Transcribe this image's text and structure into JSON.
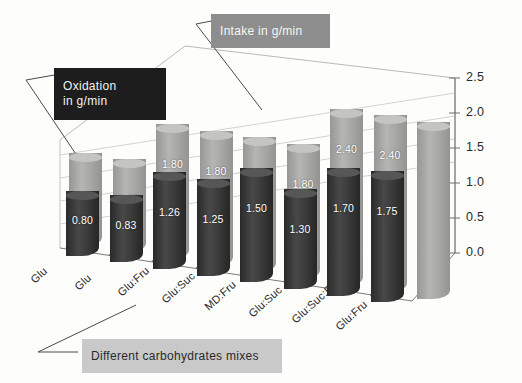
{
  "chart_data": {
    "type": "bar",
    "title": "",
    "xlabel": "Different carbohydrates mixes",
    "ylabel": "",
    "ylim": [
      0.0,
      2.5
    ],
    "yticks": [
      "0.0",
      "0.5",
      "1.0",
      "1.5",
      "2.0",
      "2.5"
    ],
    "grid": true,
    "legend_position": "callout-boxes",
    "projection": "3d-cylinder",
    "categories": [
      "Glu",
      "Glu",
      "Glu:Fru",
      "Glu:Suc",
      "MD:Fru",
      "Glu:Suc",
      "Glu:Suc:Fru",
      "Glu:Fru"
    ],
    "series": [
      {
        "name": "Intake in g/min",
        "color": "#a9a9a7",
        "values": [
          1.2,
          1.2,
          1.8,
          1.8,
          1.8,
          1.8,
          2.4,
          2.4
        ],
        "labels": [
          "",
          "1.20",
          "1.80",
          "1.80",
          "1.8",
          "1.80",
          "2.40",
          "2.40"
        ],
        "note": "ninth trailing cylinder at far right also 2.40"
      },
      {
        "name": "Oxidation in g/min",
        "color": "#3c3c3c",
        "values": [
          0.8,
          0.83,
          1.26,
          1.25,
          1.5,
          1.3,
          1.7,
          1.75
        ],
        "labels": [
          "0.80",
          "0.83",
          "1.26",
          "1.25",
          "1.50",
          "1.30",
          "1.70",
          "1.75"
        ]
      }
    ],
    "extra_label": "2.40"
  },
  "callouts": {
    "intake": "Intake in g/min",
    "oxidation": "Oxidation\nin g/min",
    "xaxis": "Different carbohydrates mixes"
  },
  "colors": {
    "bar_light": "#a9a9a7",
    "bar_light_top": "#c4c4c2",
    "bar_dark": "#3c3c3c",
    "bar_dark_top": "#565656",
    "background": "#fdfdfb",
    "grid": "#cfcfcf",
    "axis": "#6f6f6f",
    "callout_dark": "#1d1d1d",
    "callout_mid": "#8e8e8e",
    "callout_light": "#c9c9c9"
  }
}
